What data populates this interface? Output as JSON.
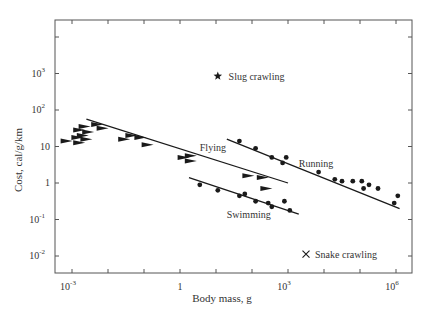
{
  "chart_data": {
    "type": "scatter",
    "title": "",
    "xlabel": "Body mass, g",
    "ylabel": "Cost, cal/g/km",
    "xscale": "log",
    "yscale": "log",
    "xlim_log10": [
      -3.3,
      6.4
    ],
    "ylim_log10": [
      -2.45,
      4.5
    ],
    "grid": false,
    "legend": "inline annotations",
    "x_ticks": [
      {
        "log10": -3,
        "label": "10",
        "sup": "-3"
      },
      {
        "log10": 0,
        "label": "1",
        "sup": ""
      },
      {
        "log10": 3,
        "label": "10",
        "sup": "3"
      },
      {
        "log10": 6,
        "label": "10",
        "sup": "6"
      }
    ],
    "y_ticks": [
      {
        "log10": 3,
        "label": "10",
        "sup": "3"
      },
      {
        "log10": 2,
        "label": "10",
        "sup": "2"
      },
      {
        "log10": 1,
        "label": "10",
        "sup": ""
      },
      {
        "log10": 0,
        "label": "1",
        "sup": ""
      },
      {
        "log10": -1,
        "label": "10",
        "sup": "-1"
      },
      {
        "log10": -2,
        "label": "10",
        "sup": "-2"
      }
    ],
    "series": [
      {
        "name": "Flying",
        "marker": "triangle-right",
        "label_pos_log10": [
          0.55,
          1.0
        ],
        "fit_line_log10": [
          [
            -2.6,
            1.75
          ],
          [
            3.0,
            0.0
          ]
        ],
        "points_log10": [
          [
            -3.15,
            1.15
          ],
          [
            -2.85,
            1.25
          ],
          [
            -2.8,
            1.1
          ],
          [
            -2.7,
            1.3
          ],
          [
            -2.6,
            1.2
          ],
          [
            -2.55,
            1.4
          ],
          [
            -2.8,
            1.45
          ],
          [
            -2.65,
            1.55
          ],
          [
            -2.3,
            1.6
          ],
          [
            -2.15,
            1.5
          ],
          [
            -1.55,
            1.2
          ],
          [
            -1.35,
            1.3
          ],
          [
            -1.1,
            1.25
          ],
          [
            -0.9,
            1.05
          ],
          [
            0.1,
            0.7
          ],
          [
            0.3,
            0.6
          ],
          [
            0.3,
            0.75
          ],
          [
            1.9,
            0.2
          ],
          [
            2.3,
            0.15
          ],
          [
            2.4,
            -0.15
          ]
        ]
      },
      {
        "name": "Running",
        "marker": "circle",
        "label_pos_log10": [
          3.3,
          0.55
        ],
        "fit_line_log10": [
          [
            1.3,
            1.2
          ],
          [
            6.1,
            -0.7
          ]
        ],
        "points_log10": [
          [
            1.65,
            1.15
          ],
          [
            2.1,
            0.95
          ],
          [
            2.55,
            0.7
          ],
          [
            2.85,
            0.55
          ],
          [
            2.95,
            0.7
          ],
          [
            3.85,
            0.3
          ],
          [
            4.3,
            0.1
          ],
          [
            4.5,
            0.05
          ],
          [
            4.8,
            0.05
          ],
          [
            5.05,
            0.05
          ],
          [
            5.1,
            -0.15
          ],
          [
            5.25,
            -0.05
          ],
          [
            5.5,
            -0.15
          ],
          [
            5.95,
            -0.55
          ],
          [
            6.05,
            -0.35
          ]
        ]
      },
      {
        "name": "Swimming",
        "marker": "circle",
        "label_pos_log10": [
          1.3,
          -0.85
        ],
        "fit_line_log10": [
          [
            0.25,
            0.15
          ],
          [
            3.3,
            -0.85
          ]
        ],
        "points_log10": [
          [
            0.55,
            -0.05
          ],
          [
            1.05,
            -0.2
          ],
          [
            1.65,
            -0.35
          ],
          [
            1.8,
            -0.3
          ],
          [
            2.1,
            -0.5
          ],
          [
            2.45,
            -0.55
          ],
          [
            2.55,
            -0.65
          ],
          [
            2.9,
            -0.5
          ],
          [
            3.05,
            -0.75
          ]
        ]
      },
      {
        "name": "Slug crawling",
        "marker": "star",
        "label_pos_log10": [
          1.35,
          2.93
        ],
        "points_log10": [
          [
            1.05,
            2.93
          ]
        ]
      },
      {
        "name": "Snake crawling",
        "marker": "x",
        "label_pos_log10": [
          3.75,
          -1.95
        ],
        "points_log10": [
          [
            3.5,
            -1.95
          ]
        ]
      }
    ]
  },
  "layout": {
    "plot_left": 55,
    "plot_right": 412,
    "plot_top": 20,
    "plot_bottom": 273,
    "x0_px": 180,
    "px_per_decade_x": 36,
    "y0_px": 183,
    "px_per_decade_y": 36.5,
    "ink": "#1a1a1a",
    "axis": "#555555"
  }
}
